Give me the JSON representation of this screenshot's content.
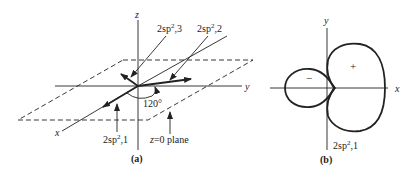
{
  "figure_a": {
    "caption": "(a)",
    "axes": {
      "x": "x",
      "y": "y",
      "z": "z"
    },
    "orbitals": [
      {
        "name": "2sp",
        "sup": "2",
        "suffix": ",1"
      },
      {
        "name": "2sp",
        "sup": "2",
        "suffix": ",2"
      },
      {
        "name": "2sp",
        "sup": "2",
        "suffix": ",3"
      }
    ],
    "angle_label": "120°",
    "plane_label": {
      "var": "z",
      "rest": "=0 plane"
    }
  },
  "figure_b": {
    "caption": "(b)",
    "axes": {
      "x": "x",
      "y": "y"
    },
    "lobe_signs": {
      "large": "+",
      "small": "−"
    },
    "orbital": {
      "name": "2sp",
      "sup": "2",
      "suffix": ",1"
    }
  },
  "colors": {
    "line": "#222222",
    "background": "#ffffff"
  }
}
